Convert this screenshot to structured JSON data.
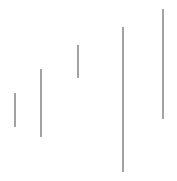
{
  "chart_data": {
    "type": "range",
    "title": "",
    "xlabel": "",
    "ylabel": "",
    "grid": false,
    "legend": null,
    "color": "#707070",
    "series": [
      {
        "name": "range",
        "x_px": [
          15,
          41,
          78,
          123,
          163
        ],
        "low_px": [
          127,
          137,
          78,
          172,
          119
        ],
        "high_px": [
          93,
          69,
          45,
          27,
          9
        ]
      }
    ],
    "segments": [
      {
        "x": 15,
        "y1": 93,
        "y2": 127
      },
      {
        "x": 41,
        "y1": 69,
        "y2": 137
      },
      {
        "x": 78,
        "y1": 45,
        "y2": 78
      },
      {
        "x": 123,
        "y1": 27,
        "y2": 172
      },
      {
        "x": 163,
        "y1": 9,
        "y2": 119
      }
    ]
  }
}
